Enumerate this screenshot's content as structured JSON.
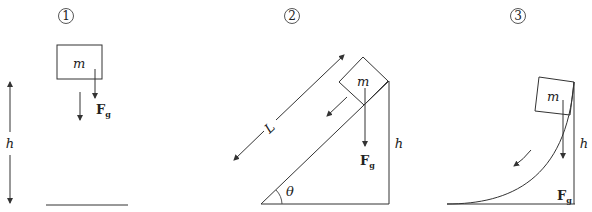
{
  "figure": {
    "panels": [
      {
        "id": "1",
        "number_label": "1",
        "mass_label": "m",
        "force_label": "F",
        "force_subscript": "g",
        "height_label": "h",
        "scenario": "free fall"
      },
      {
        "id": "2",
        "number_label": "2",
        "mass_label": "m",
        "force_label": "F",
        "force_subscript": "g",
        "height_label": "h",
        "length_label": "L",
        "angle_label": "θ",
        "scenario": "inclined plane"
      },
      {
        "id": "3",
        "number_label": "3",
        "mass_label": "m",
        "force_label": "F",
        "force_subscript": "g",
        "height_label": "h",
        "scenario": "curved ramp"
      }
    ],
    "colors": {
      "stroke": "#333333",
      "background": "#ffffff"
    }
  }
}
